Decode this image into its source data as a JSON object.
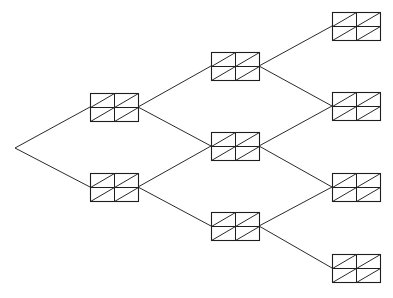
{
  "diagram": {
    "type": "binary-tree",
    "title": "",
    "colors": {
      "line": "#2a2a2a",
      "background": "#ffffff"
    },
    "root": {
      "x": 15,
      "y": 148
    },
    "box": {
      "width": 48,
      "height": 28,
      "rows": 2,
      "cols": 2,
      "cell_diagonal": "bottom-left-to-top-right"
    },
    "nodes": [
      {
        "id": "L1-0",
        "level": 1,
        "x": 90,
        "y": 93
      },
      {
        "id": "L1-1",
        "level": 1,
        "x": 90,
        "y": 173
      },
      {
        "id": "L2-0",
        "level": 2,
        "x": 211,
        "y": 52
      },
      {
        "id": "L2-1",
        "level": 2,
        "x": 211,
        "y": 132
      },
      {
        "id": "L2-2",
        "level": 2,
        "x": 211,
        "y": 212
      },
      {
        "id": "L3-0",
        "level": 3,
        "x": 332,
        "y": 12
      },
      {
        "id": "L3-1",
        "level": 3,
        "x": 332,
        "y": 92
      },
      {
        "id": "L3-2",
        "level": 3,
        "x": 332,
        "y": 173
      },
      {
        "id": "L3-3",
        "level": 3,
        "x": 332,
        "y": 254
      }
    ],
    "edges": [
      {
        "from": "root",
        "to": "L1-0"
      },
      {
        "from": "root",
        "to": "L1-1"
      },
      {
        "from": "L1-0",
        "to": "L2-0"
      },
      {
        "from": "L1-0",
        "to": "L2-1"
      },
      {
        "from": "L1-1",
        "to": "L2-1"
      },
      {
        "from": "L1-1",
        "to": "L2-2"
      },
      {
        "from": "L2-0",
        "to": "L3-0"
      },
      {
        "from": "L2-0",
        "to": "L3-1"
      },
      {
        "from": "L2-1",
        "to": "L3-1"
      },
      {
        "from": "L2-1",
        "to": "L3-2"
      },
      {
        "from": "L2-2",
        "to": "L3-2"
      },
      {
        "from": "L2-2",
        "to": "L3-3"
      }
    ]
  }
}
